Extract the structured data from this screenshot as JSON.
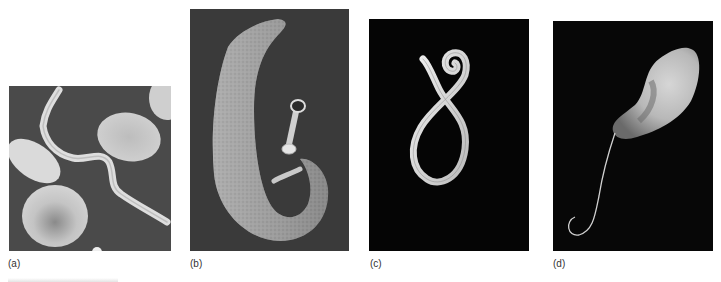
{
  "figure": {
    "panels": [
      {
        "id": "a",
        "label": "(a)",
        "subject": "trypanosome among red blood cells (scanning electron micrograph)"
      },
      {
        "id": "b",
        "label": "(b)",
        "subject": "schistosome flatworm pair (scanning electron micrograph)"
      },
      {
        "id": "c",
        "label": "(c)",
        "subject": "coiled roundworm in figure-eight shape (micrograph)"
      },
      {
        "id": "d",
        "label": "(d)",
        "subject": "flagellated protozoan with long flagellum (micrograph)"
      }
    ],
    "colors": {
      "page_background": "#ffffff",
      "label_text": "#333333",
      "panel_a_background": "#4a4a4a",
      "panel_b_background": "#3a3a3a",
      "panel_c_background": "#050505",
      "panel_d_background": "#070707",
      "specimen_light": "#d8d8d8"
    }
  }
}
